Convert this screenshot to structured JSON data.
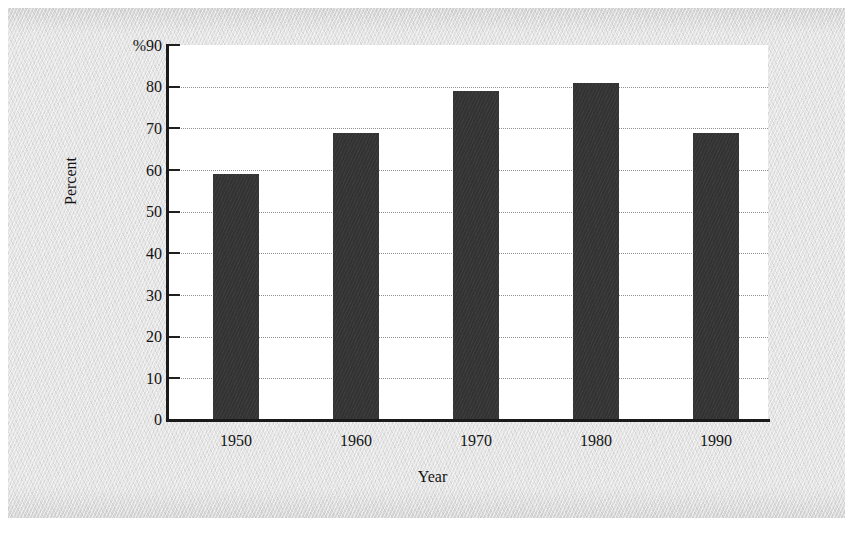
{
  "figure": {
    "background_color": "#e4e4e4",
    "plot_background_color": "#ffffff",
    "bar_color": "#333333",
    "axis_color": "#1a1a1a",
    "gridline_color": "#8f8f8f",
    "percent_symbol": "%"
  },
  "chart_data": {
    "type": "bar",
    "title": "",
    "xlabel": "Year",
    "ylabel": "Percent",
    "categories": [
      "1950",
      "1960",
      "1970",
      "1980",
      "1990"
    ],
    "values": [
      59,
      69,
      79,
      81,
      69
    ],
    "ylim": [
      0,
      90
    ],
    "ytick_labels": [
      "%90",
      "80",
      "70",
      "60",
      "50",
      "40",
      "30",
      "20",
      "10",
      "0"
    ],
    "ytick_values": [
      90,
      80,
      70,
      60,
      50,
      40,
      30,
      20,
      10,
      0
    ],
    "ytick_step": 10,
    "grid": true,
    "grid_style": "dotted",
    "grid_axis": "y",
    "legend": null,
    "legend_position": "none",
    "unit": "percent"
  }
}
